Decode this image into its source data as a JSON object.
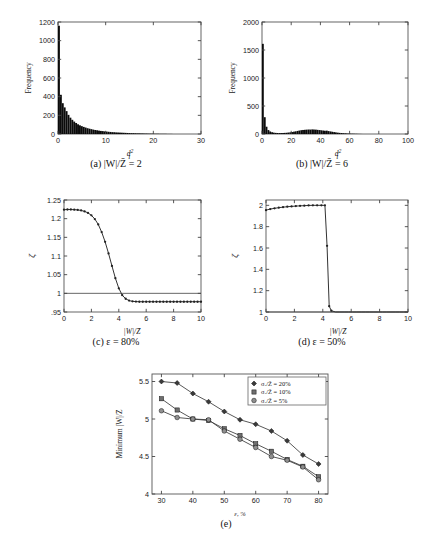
{
  "figure": {
    "panels": [
      {
        "id": "a",
        "caption_prefix": "(a)",
        "caption": "|W|/Z̄ = 2",
        "ylabel": "Frequency",
        "xlabel": "d²ᵢ"
      },
      {
        "id": "b",
        "caption_prefix": "(b)",
        "caption": "|W|/Z̄ = 6",
        "ylabel": "Frequency",
        "xlabel": "d²ᵢ"
      },
      {
        "id": "c",
        "caption_prefix": "(c)",
        "caption": "ε = 80%",
        "ylabel": "ζ",
        "xlabel": "|W|/Z̄"
      },
      {
        "id": "d",
        "caption_prefix": "(d)",
        "caption": "ε = 50%",
        "ylabel": "ζ",
        "xlabel": "|W|/Z̄"
      },
      {
        "id": "e",
        "caption_prefix": "(e)",
        "caption": "",
        "ylabel": "Minimum |W|/Z̄",
        "xlabel": "ε, %"
      }
    ]
  },
  "chart_data": [
    {
      "type": "bar",
      "panel": "a",
      "title": "(a) |W|/Z̄ = 2",
      "xlabel": "d²ᵢ",
      "ylabel": "Frequency",
      "xlim": [
        0,
        30
      ],
      "ylim": [
        0,
        1200
      ],
      "xticks": [
        0,
        10,
        20,
        30
      ],
      "yticks": [
        0,
        200,
        400,
        600,
        800,
        1000,
        1200
      ],
      "grid": false,
      "bin_width": 0.4,
      "bin_centers": [
        0.2,
        0.6,
        1.0,
        1.4,
        1.8,
        2.2,
        2.6,
        3.0,
        3.4,
        3.8,
        4.2,
        4.6,
        5.0,
        5.4,
        5.8,
        6.2,
        6.6,
        7.0,
        7.4,
        7.8,
        8.2,
        8.6,
        9.0,
        9.4,
        9.8,
        10.2,
        10.6,
        11.0,
        11.4,
        11.8,
        12.2,
        12.6,
        13.0,
        13.4,
        13.8,
        14.2,
        14.6,
        15.0,
        15.4,
        15.8,
        16.2,
        16.6,
        17.0,
        17.4,
        17.8,
        18.2,
        18.6,
        19.0,
        19.4,
        19.8,
        20.2,
        20.6,
        21.0,
        21.4,
        21.8,
        22.2,
        22.6,
        23.0,
        23.4,
        23.8
      ],
      "values": [
        1160,
        420,
        330,
        285,
        245,
        205,
        175,
        152,
        133,
        118,
        104,
        93,
        84,
        76,
        69,
        62,
        57,
        52,
        47,
        43,
        40,
        36,
        33,
        31,
        28,
        26,
        24,
        22,
        20,
        19,
        17,
        16,
        15,
        14,
        13,
        12,
        11,
        10,
        9,
        9,
        8,
        7,
        7,
        6,
        6,
        5,
        5,
        4,
        4,
        4,
        3,
        3,
        3,
        2,
        2,
        2,
        2,
        1,
        1,
        1
      ]
    },
    {
      "type": "bar",
      "panel": "b",
      "title": "(b) |W|/Z̄ = 6",
      "xlabel": "d²ᵢ",
      "ylabel": "Frequency",
      "xlim": [
        0,
        100
      ],
      "ylim": [
        0,
        2000
      ],
      "xticks": [
        0,
        20,
        40,
        60,
        80,
        100
      ],
      "yticks": [
        0,
        500,
        1000,
        1500,
        2000
      ],
      "grid": false,
      "bin_width": 1.25,
      "bin_centers": [
        0.6,
        1.9,
        3.1,
        4.4,
        5.6,
        6.9,
        8.1,
        9.4,
        10.6,
        11.9,
        13.1,
        14.4,
        15.6,
        16.9,
        18.1,
        19.4,
        20.6,
        21.9,
        23.1,
        24.4,
        25.6,
        26.9,
        28.1,
        29.4,
        30.6,
        31.9,
        33.1,
        34.4,
        35.6,
        36.9,
        38.1,
        39.4,
        40.6,
        41.9,
        43.1,
        44.4,
        45.6,
        46.9,
        48.1,
        49.4,
        50.6,
        51.9,
        53.1,
        54.4,
        55.6,
        56.9,
        58.1,
        59.4,
        60.6,
        61.9,
        63.1,
        64.4,
        65.6,
        66.9,
        68.1
      ],
      "values": [
        1610,
        300,
        130,
        70,
        45,
        32,
        24,
        20,
        18,
        17,
        17,
        18,
        20,
        22,
        26,
        30,
        35,
        42,
        48,
        55,
        62,
        68,
        72,
        75,
        78,
        80,
        79,
        82,
        80,
        78,
        74,
        70,
        66,
        62,
        58,
        60,
        52,
        46,
        40,
        34,
        29,
        24,
        20,
        17,
        14,
        12,
        10,
        8,
        7,
        6,
        5,
        4,
        3,
        2,
        1
      ]
    },
    {
      "type": "line",
      "panel": "c",
      "title": "(c) ε = 80%",
      "xlabel": "|W|/Z̄",
      "ylabel": "ζ",
      "xlim": [
        0,
        10
      ],
      "ylim": [
        0.95,
        1.25
      ],
      "xticks": [
        0,
        2,
        4,
        6,
        8,
        10
      ],
      "yticks": [
        0.95,
        1.0,
        1.05,
        1.1,
        1.15,
        1.2,
        1.25
      ],
      "grid": false,
      "reference_line_y": 1.0,
      "x": [
        0,
        0.25,
        0.5,
        0.75,
        1.0,
        1.25,
        1.5,
        1.75,
        2.0,
        2.25,
        2.5,
        2.75,
        3.0,
        3.25,
        3.5,
        3.75,
        4.0,
        4.25,
        4.5,
        4.75,
        5.0,
        5.25,
        5.5,
        5.75,
        6.0,
        6.25,
        6.5,
        6.75,
        7.0,
        7.25,
        7.5,
        7.75,
        8.0,
        8.25,
        8.5,
        8.75,
        9.0,
        9.25,
        9.5,
        9.75,
        10.0
      ],
      "values": [
        1.224,
        1.2245,
        1.2245,
        1.224,
        1.2235,
        1.222,
        1.2195,
        1.2155,
        1.209,
        1.199,
        1.1845,
        1.164,
        1.138,
        1.107,
        1.0735,
        1.0405,
        1.0135,
        0.995,
        0.9855,
        0.9805,
        0.9785,
        0.9778,
        0.9775,
        0.9775,
        0.9775,
        0.9775,
        0.9775,
        0.9775,
        0.9775,
        0.9775,
        0.9775,
        0.9775,
        0.9775,
        0.9775,
        0.9775,
        0.9775,
        0.9775,
        0.9775,
        0.9775,
        0.9775,
        0.9775
      ]
    },
    {
      "type": "line",
      "panel": "d",
      "title": "(d) ε = 50%",
      "xlabel": "|W|/Z̄",
      "ylabel": "ζ",
      "xlim": [
        0,
        10
      ],
      "ylim": [
        1.0,
        2.05
      ],
      "xticks": [
        0,
        2,
        4,
        6,
        8,
        10
      ],
      "yticks": [
        1.0,
        1.2,
        1.4,
        1.6,
        1.8,
        2.0
      ],
      "grid": false,
      "reference_line_y": 1.0,
      "x": [
        0,
        0.3,
        0.6,
        0.9,
        1.2,
        1.5,
        1.8,
        2.1,
        2.4,
        2.7,
        3.0,
        3.3,
        3.6,
        3.9,
        4.15,
        4.3,
        4.45,
        4.6,
        4.9,
        5.2,
        5.5,
        5.8,
        6.1,
        6.4,
        6.7,
        7.0,
        7.3,
        7.6,
        7.9,
        8.2,
        8.5,
        8.8,
        9.1,
        9.4,
        9.7,
        10.0
      ],
      "values": [
        1.955,
        1.965,
        1.972,
        1.978,
        1.983,
        1.987,
        1.99,
        1.993,
        1.995,
        1.997,
        1.999,
        2.0,
        2.0,
        2.0,
        2.0,
        1.62,
        1.055,
        1.012,
        0.995,
        0.99,
        0.988,
        0.987,
        0.986,
        0.986,
        0.985,
        0.985,
        0.985,
        0.984,
        0.984,
        0.984,
        0.983,
        0.983,
        0.983,
        0.982,
        0.982,
        0.982
      ]
    },
    {
      "type": "line",
      "panel": "e",
      "title": "(e)",
      "xlabel": "ε, %",
      "ylabel": "Minimum |W|/Z̄",
      "xlim": [
        27,
        83
      ],
      "ylim": [
        4.0,
        5.6
      ],
      "xticks": [
        30,
        40,
        50,
        60,
        70,
        80
      ],
      "yticks": [
        4.0,
        4.5,
        5.0,
        5.5
      ],
      "grid": false,
      "legend_position": "top-right",
      "x": [
        30,
        35,
        40,
        45,
        50,
        55,
        60,
        65,
        70,
        75,
        80
      ],
      "series": [
        {
          "name": "σₓ/Z̄ = 20%",
          "marker": "diamond",
          "values": [
            5.5,
            5.48,
            5.34,
            5.23,
            5.1,
            4.99,
            4.93,
            4.84,
            4.71,
            4.52,
            4.4
          ]
        },
        {
          "name": "σₓ/Z̄ = 10%",
          "marker": "square",
          "values": [
            5.27,
            5.12,
            5.0,
            4.98,
            4.87,
            4.78,
            4.67,
            4.57,
            4.46,
            4.37,
            4.23
          ]
        },
        {
          "name": "σₓ/Z̄ = 5%",
          "marker": "circle",
          "values": [
            5.11,
            5.02,
            5.0,
            4.99,
            4.84,
            4.73,
            4.62,
            4.5,
            4.45,
            4.36,
            4.19
          ]
        }
      ]
    }
  ]
}
